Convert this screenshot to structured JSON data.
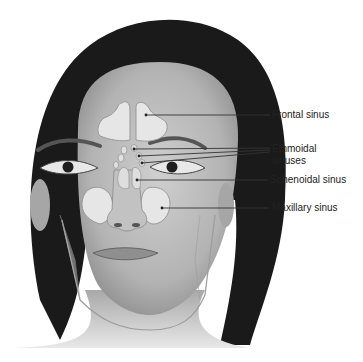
{
  "diagram": {
    "labels": [
      {
        "id": "frontal",
        "text": "Frontal sinus"
      },
      {
        "id": "ethmoidal",
        "text": "Ethmoidal\nsinuses",
        "line1": "Ethmoidal",
        "line2": "sinuses"
      },
      {
        "id": "sphenoidal",
        "text": "Sphenoidal sinus"
      },
      {
        "id": "maxillary",
        "text": "Maxillary sinus"
      }
    ],
    "colors": {
      "background": "#ffffff",
      "hair": "#1a1a1a",
      "skin": "#bdbdbd",
      "sinus_fill": "#e6e6e6",
      "leader_line": "#333333",
      "label_text": "#222222"
    }
  }
}
